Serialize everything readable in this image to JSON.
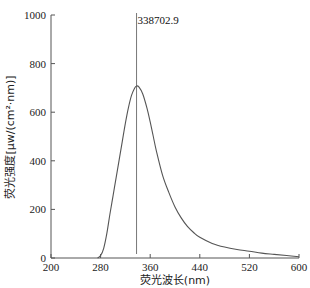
{
  "chart_data": {
    "type": "line",
    "title": "",
    "xlabel": "荧光波长(nm)",
    "ylabel": "荧光强度[μw/(cm²·nm)]",
    "xlim": [
      200,
      600
    ],
    "ylim": [
      0,
      1000
    ],
    "x_ticks": [
      200,
      280,
      360,
      440,
      520,
      600
    ],
    "y_ticks": [
      0,
      200,
      400,
      600,
      800,
      1000
    ],
    "grid": false,
    "legend": null,
    "annotations": [
      {
        "type": "vertical-line",
        "x": 338,
        "label": "338702.9"
      }
    ],
    "series": [
      {
        "name": "fluorescence spectrum",
        "color": "#555555",
        "x": [
          275,
          280,
          285,
          290,
          295,
          300,
          305,
          310,
          315,
          320,
          325,
          330,
          335,
          338,
          342,
          348,
          355,
          360,
          365,
          370,
          380,
          390,
          400,
          410,
          420,
          430,
          440,
          460,
          480,
          500,
          520,
          540,
          560,
          580,
          600
        ],
        "y": [
          0,
          10,
          40,
          100,
          180,
          255,
          330,
          405,
          480,
          555,
          620,
          670,
          700,
          708,
          703,
          675,
          615,
          560,
          500,
          440,
          340,
          270,
          210,
          165,
          130,
          105,
          85,
          60,
          45,
          35,
          28,
          20,
          15,
          10,
          5
        ]
      }
    ]
  }
}
